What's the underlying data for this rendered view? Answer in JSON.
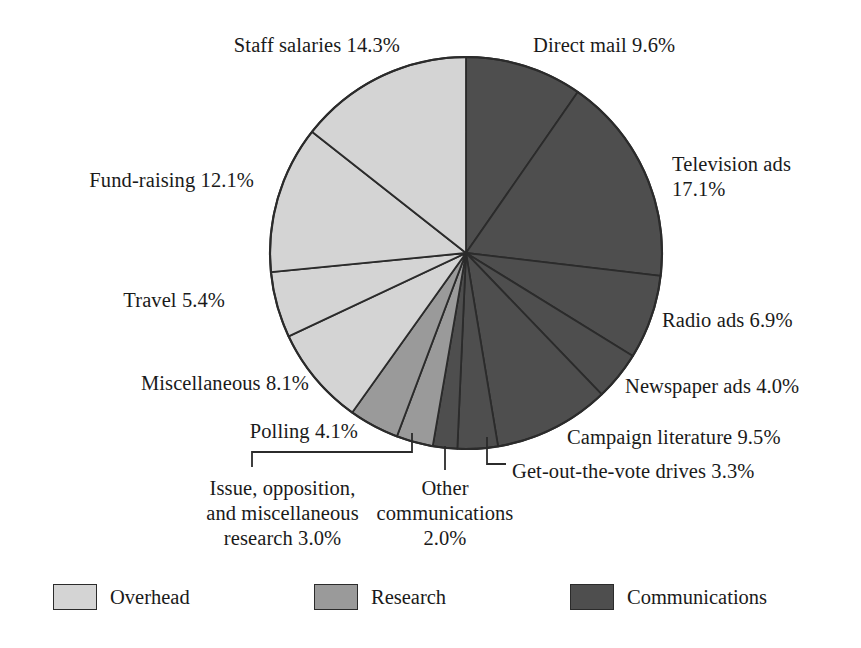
{
  "chart_data": {
    "type": "pie",
    "title": "",
    "start_angle_deg": 0,
    "direction": "clockwise",
    "center": {
      "x": 466,
      "y": 253
    },
    "radius": 196,
    "legend_position": "bottom",
    "grid": false,
    "categories": [
      "Direct mail",
      "Television ads",
      "Radio ads",
      "Newspaper ads",
      "Campaign literature",
      "Get-out-the-vote drives",
      "Other communications",
      "Issue, opposition, and miscellaneous research",
      "Polling",
      "Miscellaneous",
      "Travel",
      "Fund-raising",
      "Staff salaries"
    ],
    "values": [
      9.6,
      17.1,
      6.9,
      4.0,
      9.5,
      3.3,
      2.0,
      3.0,
      4.1,
      8.1,
      5.4,
      12.1,
      14.3
    ],
    "units": "percent",
    "groups": [
      {
        "name": "Communications",
        "color": "#4e4e4e",
        "members": [
          "Direct mail",
          "Television ads",
          "Radio ads",
          "Newspaper ads",
          "Campaign literature",
          "Get-out-the-vote drives",
          "Other communications"
        ]
      },
      {
        "name": "Research",
        "color": "#9a9a9a",
        "members": [
          "Issue, opposition, and miscellaneous research",
          "Polling"
        ]
      },
      {
        "name": "Overhead",
        "color": "#d4d4d4",
        "members": [
          "Miscellaneous",
          "Travel",
          "Fund-raising",
          "Staff salaries"
        ]
      }
    ],
    "slices": [
      {
        "label": "Direct mail",
        "value": 9.6,
        "group": "Communications",
        "color": "#4e4e4e"
      },
      {
        "label": "Television ads",
        "value": 17.1,
        "group": "Communications",
        "color": "#4e4e4e"
      },
      {
        "label": "Radio ads",
        "value": 6.9,
        "group": "Communications",
        "color": "#4e4e4e"
      },
      {
        "label": "Newspaper ads",
        "value": 4.0,
        "group": "Communications",
        "color": "#4e4e4e"
      },
      {
        "label": "Campaign literature",
        "value": 9.5,
        "group": "Communications",
        "color": "#4e4e4e"
      },
      {
        "label": "Get-out-the-vote drives",
        "value": 3.3,
        "group": "Communications",
        "color": "#4e4e4e"
      },
      {
        "label": "Other communications",
        "value": 2.0,
        "group": "Communications",
        "color": "#4e4e4e"
      },
      {
        "label": "Issue, opposition, and miscellaneous research",
        "value": 3.0,
        "group": "Research",
        "color": "#9a9a9a"
      },
      {
        "label": "Polling",
        "value": 4.1,
        "group": "Research",
        "color": "#9a9a9a"
      },
      {
        "label": "Miscellaneous",
        "value": 8.1,
        "group": "Overhead",
        "color": "#d4d4d4"
      },
      {
        "label": "Travel",
        "value": 5.4,
        "group": "Overhead",
        "color": "#d4d4d4"
      },
      {
        "label": "Fund-raising",
        "value": 12.1,
        "group": "Overhead",
        "color": "#d4d4d4"
      },
      {
        "label": "Staff salaries",
        "value": 14.3,
        "group": "Overhead",
        "color": "#d4d4d4"
      }
    ]
  },
  "labels": {
    "staff_salaries": "Staff salaries 14.3%",
    "direct_mail": "Direct mail 9.6%",
    "television_ads_line1": "Television ads",
    "television_ads_line2": "17.1%",
    "fund_raising": "Fund-raising 12.1%",
    "radio_ads": "Radio ads 6.9%",
    "travel": "Travel 5.4%",
    "newspaper_ads": "Newspaper ads 4.0%",
    "miscellaneous": "Miscellaneous 8.1%",
    "campaign_literature": "Campaign literature 9.5%",
    "polling": "Polling 4.1%",
    "get_out_the_vote": "Get-out-the-vote drives 3.3%",
    "research_line1": "Issue, opposition,",
    "research_line2": "and miscellaneous",
    "research_line3": "research 3.0%",
    "other_comms_line1": "Other",
    "other_comms_line2": "communications",
    "other_comms_line3": "2.0%"
  },
  "legend": {
    "items": [
      {
        "label": "Overhead",
        "color": "#d4d4d4"
      },
      {
        "label": "Research",
        "color": "#9a9a9a"
      },
      {
        "label": "Communications",
        "color": "#4e4e4e"
      }
    ]
  },
  "colors": {
    "overhead": "#d4d4d4",
    "research": "#9a9a9a",
    "communications": "#4e4e4e",
    "outline": "#2b2b2b",
    "text": "#1a1a1a",
    "background": "#ffffff"
  }
}
